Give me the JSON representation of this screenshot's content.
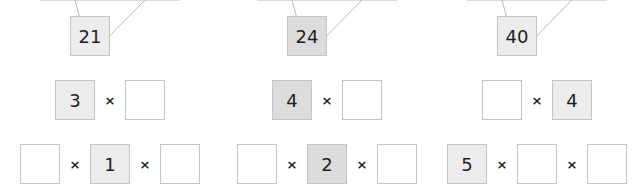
{
  "diagrams": [
    {
      "fill": "#ececec",
      "top": "21",
      "row2": [
        "3",
        ""
      ],
      "row3": [
        "",
        "1",
        ""
      ],
      "operator": "×"
    },
    {
      "fill": "#dcdcdc",
      "top": "24",
      "row2": [
        "4",
        ""
      ],
      "row3": [
        "",
        "2",
        ""
      ],
      "operator": "×"
    },
    {
      "fill": "#ececec",
      "top": "40",
      "row2": [
        "",
        "4"
      ],
      "row3": [
        "5",
        "",
        ""
      ],
      "operator": "×"
    }
  ]
}
